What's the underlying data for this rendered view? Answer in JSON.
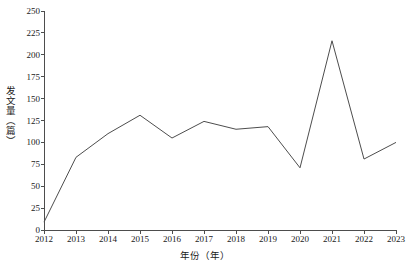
{
  "chart_data": {
    "type": "line",
    "title": "",
    "xlabel": "年份（年）",
    "ylabel": "发文量（篇）",
    "categories": [
      "2012",
      "2013",
      "2014",
      "2015",
      "2016",
      "2017",
      "2018",
      "2019",
      "2020",
      "2021",
      "2022",
      "2023"
    ],
    "x": [
      2012,
      2013,
      2014,
      2015,
      2016,
      2017,
      2018,
      2019,
      2020,
      2021,
      2022,
      2023
    ],
    "values": [
      9,
      83,
      110,
      131,
      105,
      124,
      115,
      118,
      71,
      216,
      81,
      100
    ],
    "series": [
      {
        "name": "发文量",
        "values": [
          9,
          83,
          110,
          131,
          105,
          124,
          115,
          118,
          71,
          216,
          81,
          100
        ]
      }
    ],
    "ylim": [
      0,
      250
    ],
    "xlim": [
      2012,
      2023
    ],
    "yticks": [
      0,
      25,
      50,
      75,
      100,
      125,
      150,
      175,
      200,
      225,
      250
    ],
    "ytick_labels": [
      "0",
      "25",
      "50",
      "75",
      "100",
      "125",
      "150",
      "175",
      "200",
      "225",
      "250"
    ],
    "xticks": [
      2012,
      2013,
      2014,
      2015,
      2016,
      2017,
      2018,
      2019,
      2020,
      2021,
      2022,
      2023
    ],
    "xtick_labels": [
      "2012",
      "2013",
      "2014",
      "2015",
      "2016",
      "2017",
      "2018",
      "2019",
      "2020",
      "2021",
      "2022",
      "2023"
    ],
    "grid": false,
    "legend": null,
    "legend_position": "none",
    "line_color": "#4d4d4d",
    "line_width": 1,
    "markers": false,
    "background_color": "#ffffff",
    "axis_color": "#4d4d4d",
    "annotations": []
  }
}
